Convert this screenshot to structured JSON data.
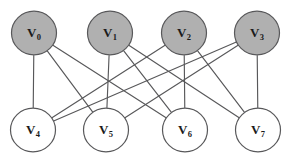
{
  "figure": {
    "name": "bipartite-graph",
    "background_color": "#ffffff",
    "edge_color": "#58585a",
    "node_stroke_color": "#58585a"
  },
  "chart_data": {
    "type": "diagram",
    "title": "",
    "graph_kind": "bipartite-graph",
    "node_radius": 22.5,
    "top_row_y": 33,
    "bottom_row_y": 130,
    "nodes": [
      {
        "id": "v0",
        "label": "V",
        "subscript": "0",
        "x": 34,
        "y": 33,
        "fill": "#b0b0b0",
        "row": "top"
      },
      {
        "id": "v1",
        "label": "V",
        "subscript": "1",
        "x": 110,
        "y": 33,
        "fill": "#b0b0b0",
        "row": "top"
      },
      {
        "id": "v2",
        "label": "V",
        "subscript": "2",
        "x": 184,
        "y": 33,
        "fill": "#b0b0b0",
        "row": "top"
      },
      {
        "id": "v3",
        "label": "V",
        "subscript": "3",
        "x": 257,
        "y": 33,
        "fill": "#b0b0b0",
        "row": "top"
      },
      {
        "id": "v4",
        "label": "V",
        "subscript": "4",
        "x": 33,
        "y": 130,
        "fill": "#ffffff",
        "row": "bottom"
      },
      {
        "id": "v5",
        "label": "V",
        "subscript": "5",
        "x": 106,
        "y": 130,
        "fill": "#ffffff",
        "row": "bottom"
      },
      {
        "id": "v6",
        "label": "V",
        "subscript": "6",
        "x": 185,
        "y": 130,
        "fill": "#ffffff",
        "row": "bottom"
      },
      {
        "id": "v7",
        "label": "V",
        "subscript": "7",
        "x": 258,
        "y": 130,
        "fill": "#ffffff",
        "row": "bottom"
      }
    ],
    "edges": [
      {
        "from": "v0",
        "to": "v4"
      },
      {
        "from": "v0",
        "to": "v5"
      },
      {
        "from": "v0",
        "to": "v6"
      },
      {
        "from": "v1",
        "to": "v5"
      },
      {
        "from": "v1",
        "to": "v6"
      },
      {
        "from": "v1",
        "to": "v7"
      },
      {
        "from": "v2",
        "to": "v6"
      },
      {
        "from": "v2",
        "to": "v7"
      },
      {
        "from": "v2",
        "to": "v4"
      },
      {
        "from": "v3",
        "to": "v7"
      },
      {
        "from": "v3",
        "to": "v4"
      },
      {
        "from": "v3",
        "to": "v5"
      }
    ]
  }
}
